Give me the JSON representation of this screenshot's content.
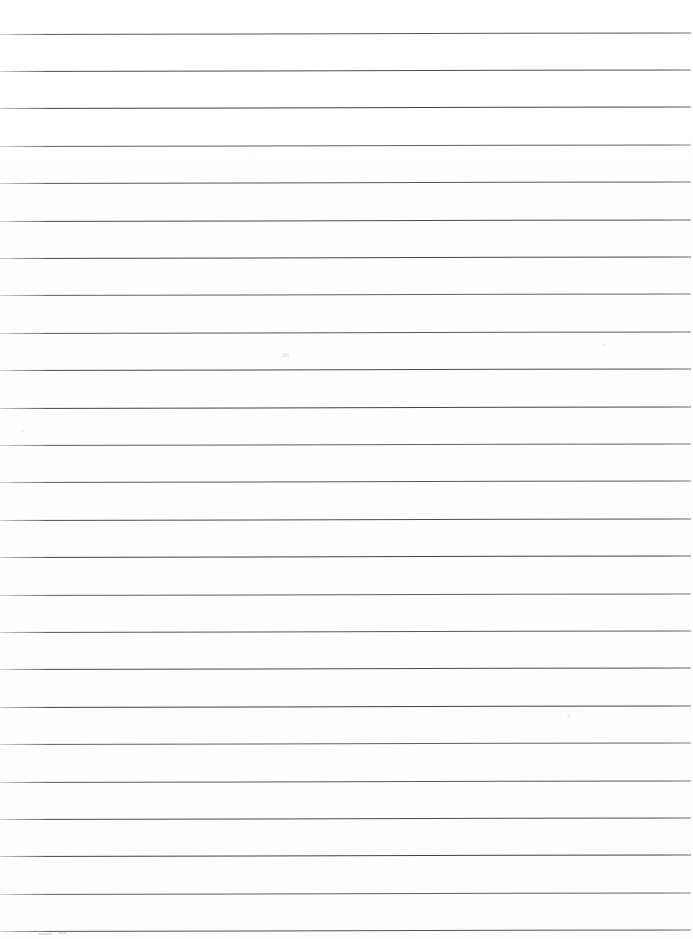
{
  "document": {
    "type": "scanned-lined-paper",
    "title": "Blank ruled notebook page",
    "page_width": 693,
    "page_height": 939,
    "background_color": "#ffffff",
    "rule_color": "#4a4a4c",
    "rule_thickness_px": 1,
    "rule_count": 24,
    "first_rule_y": 33.5,
    "rule_spacing_px": 37.4,
    "rule_left_x": 0,
    "rule_right_x": 691,
    "skew_degrees": -0.13,
    "text_content": "",
    "written_content_present": false
  },
  "rules": [
    {
      "index": 1,
      "y": 33.5,
      "label": "rule-1"
    },
    {
      "index": 2,
      "y": 70.9,
      "label": "rule-2"
    },
    {
      "index": 3,
      "y": 108.3,
      "label": "rule-3"
    },
    {
      "index": 4,
      "y": 145.7,
      "label": "rule-4"
    },
    {
      "index": 5,
      "y": 183.1,
      "label": "rule-5"
    },
    {
      "index": 6,
      "y": 220.5,
      "label": "rule-6"
    },
    {
      "index": 7,
      "y": 257.9,
      "label": "rule-7"
    },
    {
      "index": 8,
      "y": 295.3,
      "label": "rule-8"
    },
    {
      "index": 9,
      "y": 332.7,
      "label": "rule-9"
    },
    {
      "index": 10,
      "y": 370.1,
      "label": "rule-10"
    },
    {
      "index": 11,
      "y": 407.5,
      "label": "rule-11"
    },
    {
      "index": 12,
      "y": 444.9,
      "label": "rule-12"
    },
    {
      "index": 13,
      "y": 482.3,
      "label": "rule-13"
    },
    {
      "index": 14,
      "y": 519.7,
      "label": "rule-14"
    },
    {
      "index": 15,
      "y": 557.1,
      "label": "rule-15"
    },
    {
      "index": 16,
      "y": 594.5,
      "label": "rule-16"
    },
    {
      "index": 17,
      "y": 631.9,
      "label": "rule-17"
    },
    {
      "index": 18,
      "y": 669.3,
      "label": "rule-18"
    },
    {
      "index": 19,
      "y": 706.7,
      "label": "rule-19"
    },
    {
      "index": 20,
      "y": 744.1,
      "label": "rule-20"
    },
    {
      "index": 21,
      "y": 781.5,
      "label": "rule-21"
    },
    {
      "index": 22,
      "y": 818.9,
      "label": "rule-22"
    },
    {
      "index": 23,
      "y": 856.3,
      "label": "rule-23"
    },
    {
      "index": 24,
      "y": 893.7,
      "label": "rule-24"
    },
    {
      "index": 25,
      "y": 931.1,
      "label": "rule-25"
    }
  ],
  "artifacts": [
    {
      "name": "bottom-left-smudge",
      "x": 38,
      "y": 933,
      "width": 14,
      "height": 2,
      "color": "#bdbdbd"
    },
    {
      "name": "bottom-left-smudge-2",
      "x": 58,
      "y": 932,
      "width": 9,
      "height": 2,
      "color": "#c4c4c4"
    },
    {
      "name": "mid-page-speck",
      "x": 282,
      "y": 353,
      "width": 7,
      "height": 4,
      "color": "#d8d8d8"
    },
    {
      "name": "upper-right-speck",
      "x": 603,
      "y": 343,
      "width": 3,
      "height": 3,
      "color": "#dedede"
    },
    {
      "name": "lower-right-speck",
      "x": 567,
      "y": 714,
      "width": 4,
      "height": 3,
      "color": "#dedede"
    },
    {
      "name": "left-margin-speck",
      "x": 21,
      "y": 430,
      "width": 3,
      "height": 2,
      "color": "#dcdcdc"
    }
  ]
}
